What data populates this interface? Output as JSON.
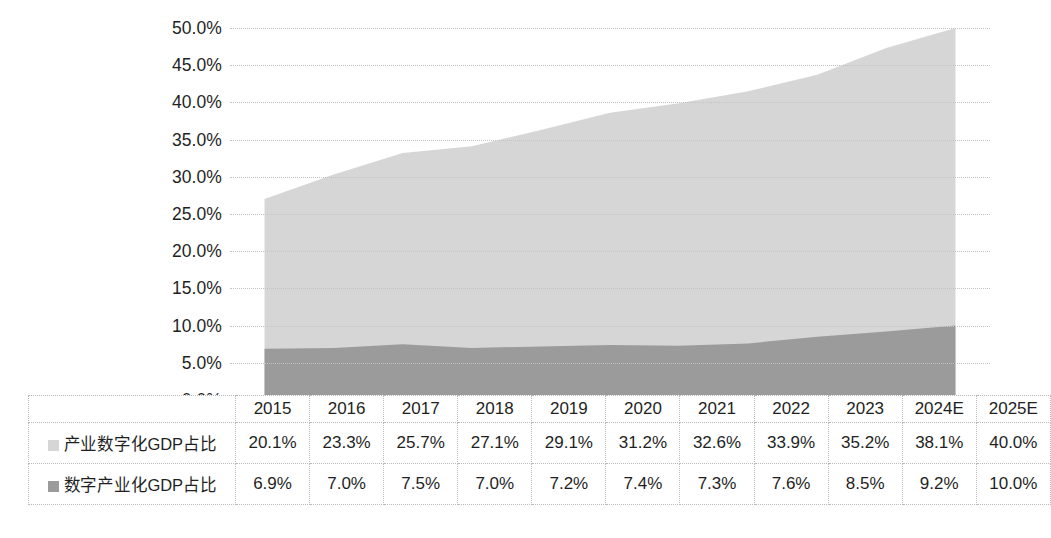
{
  "chart_data": {
    "type": "area",
    "stacked": true,
    "title": "",
    "subtitle": "",
    "xlabel": "",
    "ylabel": "",
    "categories": [
      "2015",
      "2016",
      "2017",
      "2018",
      "2019",
      "2020",
      "2021",
      "2022",
      "2023",
      "2024E",
      "2025E"
    ],
    "ylim": [
      0,
      50
    ],
    "y_tick_labels": [
      "0.0%",
      "5.0%",
      "10.0%",
      "15.0%",
      "20.0%",
      "25.0%",
      "30.0%",
      "35.0%",
      "40.0%",
      "45.0%",
      "50.0%"
    ],
    "y_tick_values": [
      0,
      5,
      10,
      15,
      20,
      25,
      30,
      35,
      40,
      45,
      50
    ],
    "grid": true,
    "legend_position": "table-left",
    "series": [
      {
        "name": "产业数字化GDP占比",
        "color": "#d6d6d6",
        "values": [
          20.1,
          23.3,
          25.7,
          27.1,
          29.1,
          31.2,
          32.6,
          33.9,
          35.2,
          38.1,
          40.0
        ],
        "labels": [
          "20.1%",
          "23.3%",
          "25.7%",
          "27.1%",
          "29.1%",
          "31.2%",
          "32.6%",
          "33.9%",
          "35.2%",
          "38.1%",
          "40.0%"
        ]
      },
      {
        "name": "数字产业化GDP占比",
        "color": "#9b9b9b",
        "values": [
          6.9,
          7.0,
          7.5,
          7.0,
          7.2,
          7.4,
          7.3,
          7.6,
          8.5,
          9.2,
          10.0
        ],
        "labels": [
          "6.9%",
          "7.0%",
          "7.5%",
          "7.0%",
          "7.2%",
          "7.4%",
          "7.3%",
          "7.6%",
          "8.5%",
          "9.2%",
          "10.0%"
        ]
      }
    ]
  },
  "table": {
    "header_row": [
      "2015",
      "2016",
      "2017",
      "2018",
      "2019",
      "2020",
      "2021",
      "2022",
      "2023",
      "2024E",
      "2025E"
    ],
    "rows": [
      {
        "label": "产业数字化GDP占比",
        "swatch_color": "#d6d6d6",
        "values": [
          "20.1%",
          "23.3%",
          "25.7%",
          "27.1%",
          "29.1%",
          "31.2%",
          "32.6%",
          "33.9%",
          "35.2%",
          "38.1%",
          "40.0%"
        ]
      },
      {
        "label": "数字产业化GDP占比",
        "swatch_color": "#9b9b9b",
        "values": [
          "6.9%",
          "7.0%",
          "7.5%",
          "7.0%",
          "7.2%",
          "7.4%",
          "7.3%",
          "7.6%",
          "8.5%",
          "9.2%",
          "10.0%"
        ]
      }
    ]
  },
  "colors": {
    "upper_area": "#d6d6d6",
    "lower_area": "#9b9b9b",
    "gridline": "#c3c3c3",
    "text": "#1f1f1f",
    "table_border": "#b9b9b9"
  }
}
